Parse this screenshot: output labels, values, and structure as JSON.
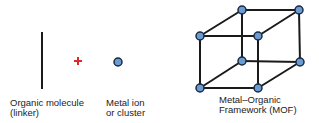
{
  "labels": {
    "linker": "Organic molecule\n(linker)",
    "metal": "Metal ion\nor cluster",
    "mof": "Metal–Organic\nFramework (MOF)"
  },
  "symbols": {
    "plus": "+"
  },
  "colors": {
    "line": "#1a1a1a",
    "plus": "#e0282a",
    "node_fill": "#6b9bd3",
    "node_stroke": "#1a2a40"
  }
}
